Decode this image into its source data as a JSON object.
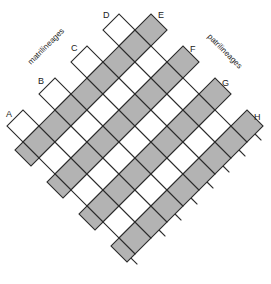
{
  "diagram": {
    "type": "diamond-lattice",
    "axis_labels": {
      "left": "matrilineages",
      "right": "patrilineages"
    },
    "corner_labels": {
      "left_side": [
        "A",
        "B",
        "C",
        "D"
      ],
      "right_side": [
        "E",
        "F",
        "G",
        "H"
      ]
    },
    "colors": {
      "shaded": "#b3b3b3",
      "white": "#ffffff",
      "stroke": "#2a2a2a"
    },
    "grid": {
      "rows": 8,
      "cols": 8,
      "shading_rule": "rows parallel to matrilineage axis alternate white/shaded; A-D rows white, E-H rows shaded"
    }
  }
}
